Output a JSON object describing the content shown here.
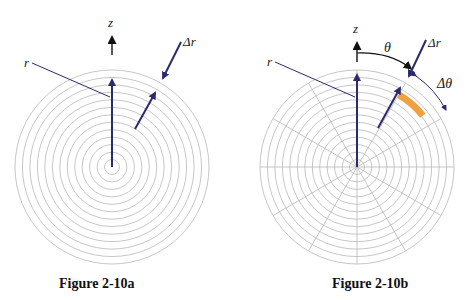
{
  "figures": [
    {
      "id": "a",
      "caption": "Figure 2-10a",
      "labels": {
        "axis": "z",
        "radius": "r",
        "delta_r": "Δr"
      },
      "center": [
        112,
        167
      ],
      "outer_radius": 97,
      "ring_count": 13,
      "radial_lines": 0
    },
    {
      "id": "b",
      "caption": "Figure 2-10b",
      "labels": {
        "axis": "z",
        "radius": "r",
        "delta_r": "Δr",
        "angle": "θ",
        "delta_theta": "Δθ"
      },
      "center": [
        357,
        167
      ],
      "outer_radius": 97,
      "ring_count": 13,
      "radial_lines": 12
    }
  ],
  "colors": {
    "ring": "#b8b8b8",
    "arrow": "#2a2a6e",
    "axis_arrow": "#111111",
    "highlight": "#f0a040"
  }
}
